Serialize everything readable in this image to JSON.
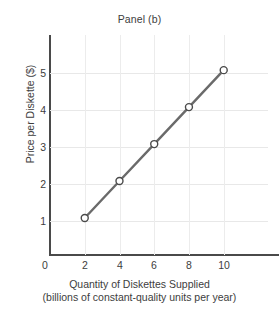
{
  "chart_data": {
    "type": "line",
    "title": "Panel (b)",
    "xlabel": "Quantity of Diskettes Supplied",
    "xlabel_sub": "(billions of constant-quality units per year)",
    "ylabel": "Price per Diskette ($)",
    "x": [
      2,
      4,
      6,
      8,
      10
    ],
    "values": [
      1,
      2,
      3,
      4,
      5
    ],
    "series": [
      {
        "name": "Supply",
        "points": [
          {
            "x": 2,
            "y": 1
          },
          {
            "x": 4,
            "y": 2
          },
          {
            "x": 6,
            "y": 3
          },
          {
            "x": 8,
            "y": 4
          },
          {
            "x": 10,
            "y": 5
          }
        ]
      }
    ],
    "xticks": [
      "0",
      "2",
      "4",
      "6",
      "8",
      "10"
    ],
    "yticks": [
      "1",
      "2",
      "3",
      "4",
      "5"
    ],
    "xlim": [
      0,
      12.55
    ],
    "ylim": [
      0,
      5.95
    ],
    "grid": true,
    "legend": "none",
    "colors": {
      "line": "#6a6a6a",
      "marker_fill": "#ffffff",
      "marker_stroke": "#4a4a4a",
      "axis": "#4a4a4a",
      "grid": "#e8e8e8",
      "text": "#3d3d3d",
      "background": "#ffffff"
    }
  }
}
